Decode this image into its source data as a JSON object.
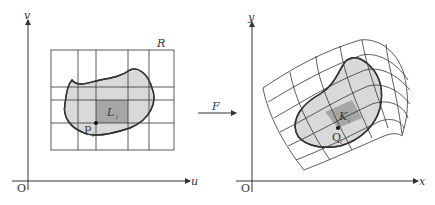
{
  "left_panel": {
    "axis_x_label": "u",
    "axis_y_label": "v",
    "origin_label": "O",
    "region_label": "R",
    "cell_label": "L",
    "cell_subscript": "i",
    "point_label": "P",
    "point_subscript": "i"
  },
  "mapping": {
    "label": "F"
  },
  "right_panel": {
    "axis_x_label": "x",
    "axis_y_label": "y",
    "origin_label": "O",
    "cell_label": "K",
    "cell_subscript": "i",
    "point_label": "Q",
    "point_subscript": "i"
  },
  "colors": {
    "line": "#333333",
    "region_fill": "#d9d9d9",
    "cell_fill": "#a6a6a6"
  }
}
